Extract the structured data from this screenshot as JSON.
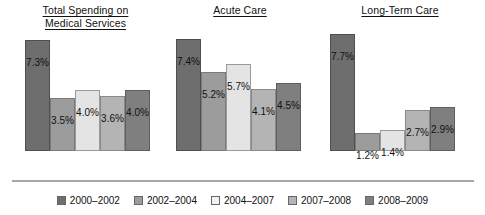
{
  "chart_data": {
    "type": "bar",
    "title": "",
    "xlabel": "",
    "ylabel": "",
    "ylim": [
      0,
      8
    ],
    "grid": false,
    "legend_position": "bottom",
    "value_suffix": "%",
    "categories": [
      "Total Spending on Medical Services",
      "Acute Care",
      "Long-Term Care"
    ],
    "series": [
      {
        "name": "2000–2002",
        "color": "#6e6e6e",
        "values": [
          7.3,
          7.4,
          7.7
        ]
      },
      {
        "name": "2002–2004",
        "color": "#9c9c9c",
        "values": [
          3.5,
          5.2,
          1.2
        ]
      },
      {
        "name": "2004–2007",
        "color": "#e4e4e4",
        "values": [
          4.0,
          5.7,
          1.4
        ]
      },
      {
        "name": "2007–2008",
        "color": "#b4b4b4",
        "values": [
          3.6,
          4.1,
          2.7
        ]
      },
      {
        "name": "2008–2009",
        "color": "#7f7f7f",
        "values": [
          4.0,
          4.5,
          2.9
        ]
      }
    ],
    "data_labels": [
      [
        "7.3%",
        "3.5%",
        "4.0%",
        "3.6%",
        "4.0%"
      ],
      [
        "7.4%",
        "5.2%",
        "5.7%",
        "4.1%",
        "4.5%"
      ],
      [
        "7.7%",
        "1.2%",
        "1.4%",
        "2.7%",
        "2.9%"
      ]
    ]
  },
  "groups": {
    "total": {
      "line1": "Total Spending on",
      "line2": "Medical Services"
    },
    "acute": {
      "line1": "Acute Care"
    },
    "ltc": {
      "line1": "Long-Term Care"
    }
  },
  "legend": {
    "items": [
      {
        "label": "2000–2002"
      },
      {
        "label": "2002–2004"
      },
      {
        "label": "2004–2007"
      },
      {
        "label": "2007–2008"
      },
      {
        "label": "2008–2009"
      }
    ]
  },
  "layout": {
    "baseline_y": 180,
    "px_per_percent": 15.2,
    "bar_width": 25,
    "groups_x": [
      25,
      176,
      330
    ]
  }
}
